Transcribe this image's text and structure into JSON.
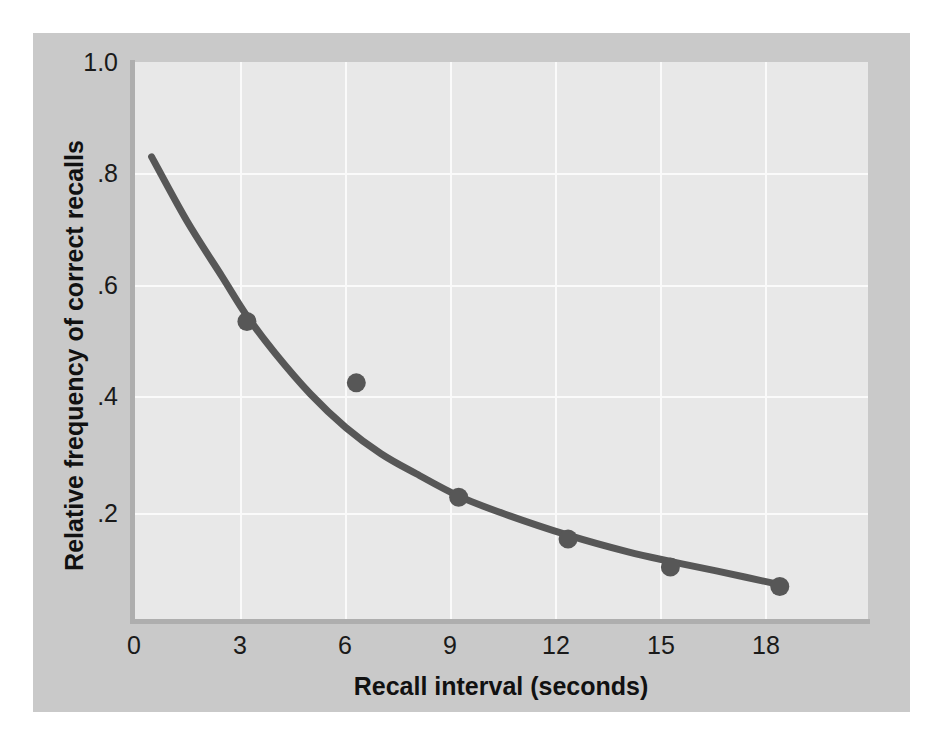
{
  "figure": {
    "background_color": "#ffffff",
    "card_color": "#c9c9c9",
    "plot_background_color": "#e8e8e8",
    "grid_color": "#fafafa",
    "axis_color": "#aeaeae",
    "series_color": "#575757"
  },
  "chart_data": {
    "type": "scatter",
    "title": "",
    "subtitle": "",
    "xlabel": "Recall interval (seconds)",
    "ylabel": "Relative frequency of correct recalls",
    "xlim": [
      0,
      20.8
    ],
    "ylim": [
      0,
      1.0
    ],
    "xticks": [
      0,
      3,
      6,
      9,
      12,
      15,
      18
    ],
    "xtick_labels": [
      "0",
      "3",
      "6",
      "9",
      "12",
      "15",
      "18"
    ],
    "yticks": [
      0.2,
      0.4,
      0.6,
      0.8,
      1.0
    ],
    "ytick_labels": [
      ".2",
      ".4",
      ".6",
      ".8",
      "1.0"
    ],
    "grid": true,
    "legend": null,
    "annotations": [],
    "series": [
      {
        "name": "Observed recall data",
        "type": "scatter",
        "marker": "circle",
        "color": "#575757",
        "points": [
          {
            "x": 3.2,
            "y": 0.535
          },
          {
            "x": 6.3,
            "y": 0.425
          },
          {
            "x": 9.2,
            "y": 0.22
          },
          {
            "x": 12.3,
            "y": 0.145
          },
          {
            "x": 15.2,
            "y": 0.095
          },
          {
            "x": 18.3,
            "y": 0.06
          }
        ]
      },
      {
        "name": "Fitted forgetting curve",
        "type": "line",
        "color": "#575757",
        "points": [
          {
            "x": 0.5,
            "y": 0.83
          },
          {
            "x": 1.5,
            "y": 0.715
          },
          {
            "x": 2.5,
            "y": 0.615
          },
          {
            "x": 3.2,
            "y": 0.545
          },
          {
            "x": 4.0,
            "y": 0.478
          },
          {
            "x": 5.0,
            "y": 0.405
          },
          {
            "x": 6.0,
            "y": 0.345
          },
          {
            "x": 7.0,
            "y": 0.298
          },
          {
            "x": 8.0,
            "y": 0.262
          },
          {
            "x": 9.2,
            "y": 0.222
          },
          {
            "x": 10.5,
            "y": 0.19
          },
          {
            "x": 12.3,
            "y": 0.152
          },
          {
            "x": 14.0,
            "y": 0.122
          },
          {
            "x": 15.2,
            "y": 0.105
          },
          {
            "x": 16.5,
            "y": 0.088
          },
          {
            "x": 18.4,
            "y": 0.062
          }
        ]
      }
    ]
  }
}
